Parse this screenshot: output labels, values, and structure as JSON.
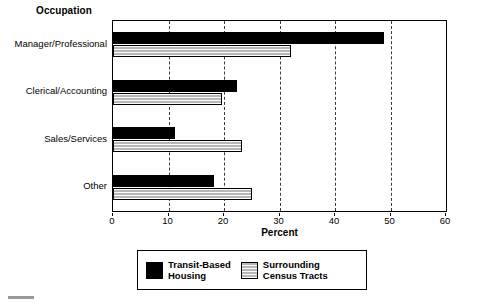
{
  "chart_data": {
    "type": "bar",
    "orientation": "horizontal",
    "title": "Occupation",
    "xlabel": "Percent",
    "ylabel": "",
    "xlim": [
      0,
      60
    ],
    "xticks": [
      0,
      10,
      20,
      30,
      40,
      50,
      60
    ],
    "grid": true,
    "grid_axis": "x",
    "legend_position": "bottom",
    "categories": [
      "Manager/Professional",
      "Clerical/Accounting",
      "Sales/Services",
      "Other"
    ],
    "series": [
      {
        "name": "Transit-Based Housing",
        "legend_label": "Transit-Based\nHousing",
        "color": "#000000",
        "values": [
          48.8,
          22.3,
          11.2,
          18.2
        ]
      },
      {
        "name": "Surrounding Census Tracts",
        "legend_label": "Surrounding\nCensus Tracts",
        "color": "#b7b7b7",
        "values": [
          32.1,
          19.6,
          23.2,
          25.0
        ]
      }
    ]
  },
  "legend": {
    "items": [
      {
        "label": "Transit-Based\nHousing",
        "swatch": "dark"
      },
      {
        "label": "Surrounding\nCensus Tracts",
        "swatch": "hatch"
      }
    ]
  },
  "axis": {
    "x_label": "Percent",
    "tick_labels": [
      "0",
      "10",
      "20",
      "30",
      "40",
      "50",
      "60"
    ]
  },
  "y_labels": [
    "Manager/Professional",
    "Clerical/Accounting",
    "Sales/Services",
    "Other"
  ],
  "title": "Occupation"
}
